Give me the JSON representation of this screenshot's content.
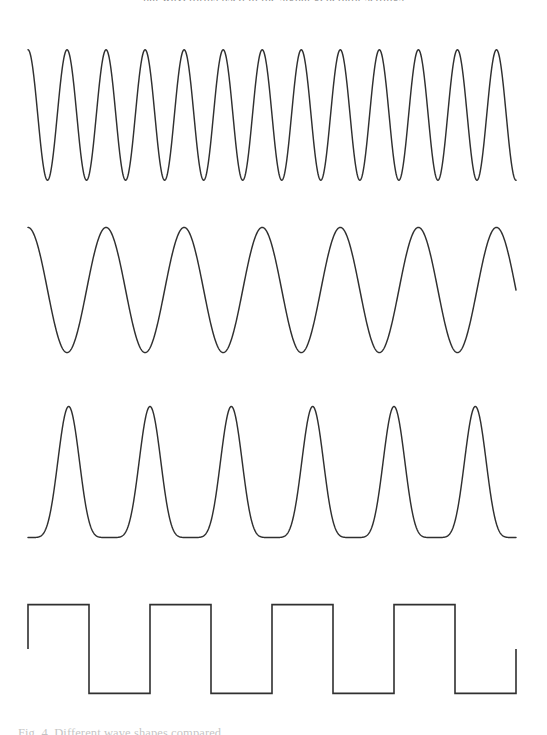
{
  "figure": {
    "name": "waveform-series-figure",
    "background_color": "#ffffff",
    "stroke_color": "#303030",
    "top_caption_fragment": "nal waveforms used in the signal generator settings",
    "bottom_caption_fragment": "Fig. 4.  Different wave shapes compared.",
    "panel_count": 4
  },
  "chart_data": [
    {
      "type": "line",
      "name": "high-frequency-sine",
      "title": "",
      "xlabel": "",
      "ylabel": "",
      "waveform": "sine",
      "cycles": 12.5,
      "peaks": 13,
      "amplitude": 1.0,
      "phase_deg": 90,
      "x": [
        0,
        1
      ],
      "xlim": [
        0,
        1
      ],
      "ylim": [
        -1.15,
        1.15
      ],
      "grid": false,
      "axes_visible": false,
      "legend": "none",
      "plot_box_px": {
        "x0": 28,
        "x1": 516,
        "y_top": 40,
        "y_bottom": 190
      }
    },
    {
      "type": "line",
      "name": "mid-frequency-sine",
      "title": "",
      "xlabel": "",
      "ylabel": "",
      "waveform": "sine",
      "cycles": 6.25,
      "peaks": 7,
      "amplitude": 1.0,
      "phase_deg": 90,
      "x": [
        0,
        1
      ],
      "xlim": [
        0,
        1
      ],
      "ylim": [
        -1.15,
        1.15
      ],
      "grid": false,
      "axes_visible": false,
      "legend": "none",
      "plot_box_px": {
        "x0": 28,
        "x1": 516,
        "y_top": 218,
        "y_bottom": 362
      }
    },
    {
      "type": "line",
      "name": "narrow-peak-pulse-train",
      "title": "",
      "xlabel": "",
      "ylabel": "",
      "waveform": "raised-cosine-power",
      "exponent": 6,
      "cycles": 6,
      "peaks": 6,
      "amplitude": 1.0,
      "x": [
        0,
        1
      ],
      "xlim": [
        0,
        1
      ],
      "ylim": [
        -0.08,
        1.08
      ],
      "grid": false,
      "axes_visible": false,
      "legend": "none",
      "plot_box_px": {
        "x0": 28,
        "x1": 516,
        "y_top": 396,
        "y_bottom": 548
      }
    },
    {
      "type": "line",
      "name": "square-wave",
      "title": "",
      "xlabel": "",
      "ylabel": "",
      "waveform": "square",
      "cycles": 4,
      "duty_cycle_pct": 50,
      "high_level": 1.0,
      "low_level": -1.0,
      "start_level": 0.0,
      "end_level": 0.0,
      "x": [
        0,
        1
      ],
      "xlim": [
        0,
        1
      ],
      "ylim": [
        -1.15,
        1.15
      ],
      "grid": false,
      "axes_visible": false,
      "legend": "none",
      "plot_box_px": {
        "x0": 28,
        "x1": 516,
        "y_top": 598,
        "y_bottom": 700
      }
    }
  ]
}
